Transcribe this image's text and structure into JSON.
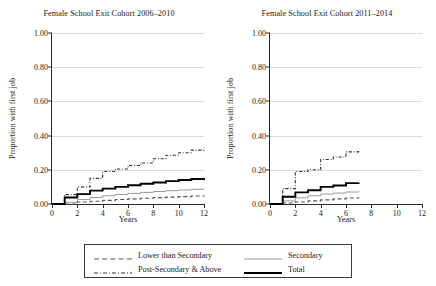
{
  "chart_data": {
    "type": "line",
    "subtype": "step",
    "xlabel": "Years",
    "ylabel": "Proportion with first job",
    "xlim": [
      0,
      12
    ],
    "ylim": [
      0,
      1.0
    ],
    "xticks": [
      0,
      2,
      4,
      6,
      8,
      10,
      12
    ],
    "xtick_labels": [
      "0",
      "2",
      "4",
      "6",
      "8",
      "10",
      "12"
    ],
    "yticks": [
      0.0,
      0.2,
      0.4,
      0.6,
      0.8,
      1.0
    ],
    "ytick_labels": [
      "0.00",
      "0.20",
      "0.40",
      "0.60",
      "0.80",
      "1.00"
    ],
    "grid": "horizontal",
    "legend_position": "bottom-center",
    "legend_entries": [
      "Lower than Secondary",
      "Secondary",
      "Post-Secondary & Above",
      "Total"
    ],
    "panels": [
      {
        "title": "Female School Exit Cohort 2006–2010",
        "x": [
          0,
          1,
          2,
          3,
          4,
          5,
          6,
          7,
          8,
          9,
          10,
          11,
          12
        ],
        "series": [
          {
            "name": "Lower than Secondary",
            "style": "dashed",
            "values": [
              0.0,
              0.0,
              0.012,
              0.016,
              0.021,
              0.026,
              0.03,
              0.034,
              0.037,
              0.04,
              0.043,
              0.047,
              0.05
            ]
          },
          {
            "name": "Secondary",
            "style": "thin-solid",
            "values": [
              0.0,
              0.01,
              0.026,
              0.038,
              0.048,
              0.056,
              0.062,
              0.068,
              0.073,
              0.078,
              0.082,
              0.086,
              0.09
            ]
          },
          {
            "name": "Post-Secondary & Above",
            "style": "dash-dot",
            "values": [
              0.0,
              0.055,
              0.1,
              0.15,
              0.19,
              0.205,
              0.225,
              0.24,
              0.265,
              0.285,
              0.3,
              0.315,
              0.33
            ]
          },
          {
            "name": "Total",
            "style": "thick-solid",
            "values": [
              0.0,
              0.038,
              0.058,
              0.078,
              0.09,
              0.1,
              0.11,
              0.118,
              0.126,
              0.134,
              0.14,
              0.146,
              0.152
            ]
          }
        ]
      },
      {
        "title": "Female School Exit Cohort 2011–2014",
        "x": [
          0,
          1,
          2,
          3,
          4,
          5,
          6,
          7
        ],
        "series": [
          {
            "name": "Lower than Secondary",
            "style": "dashed",
            "values": [
              0.0,
              0.006,
              0.012,
              0.018,
              0.024,
              0.03,
              0.035,
              0.04
            ]
          },
          {
            "name": "Secondary",
            "style": "thin-solid",
            "values": [
              0.0,
              0.018,
              0.036,
              0.048,
              0.058,
              0.064,
              0.07,
              0.076
            ]
          },
          {
            "name": "Post-Secondary & Above",
            "style": "dash-dot",
            "values": [
              0.0,
              0.09,
              0.19,
              0.2,
              0.26,
              0.275,
              0.305,
              0.31
            ]
          },
          {
            "name": "Total",
            "style": "thick-solid",
            "values": [
              0.0,
              0.042,
              0.068,
              0.08,
              0.1,
              0.108,
              0.122,
              0.125
            ]
          }
        ]
      }
    ],
    "colors": {
      "axis": "#2b2b2b",
      "grid": "#d9d9d9",
      "total": "#000000",
      "secondary": "#9a9a9a",
      "lower_than_secondary": "#555555",
      "post_secondary": "#333333",
      "background": "#ffffff"
    }
  }
}
